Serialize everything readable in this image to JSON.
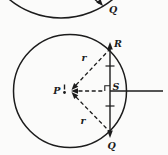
{
  "figure": {
    "background_color": "#fbfbfa",
    "stroke_color": "#1c1c1c",
    "top_circle": {
      "point_q_label": "Q"
    },
    "bottom_circle": {
      "center_label": "P",
      "point_r_label": "R",
      "point_q_label": "Q",
      "point_s_label": "S",
      "radius_upper_label": "r",
      "radius_lower_label": "r"
    }
  }
}
